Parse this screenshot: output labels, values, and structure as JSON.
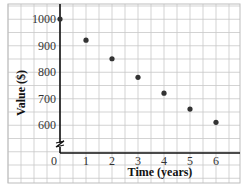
{
  "chart_data": {
    "type": "scatter",
    "title": "",
    "xlabel": "Time (years)",
    "ylabel": "Value ($)",
    "x": [
      0,
      1,
      2,
      3,
      4,
      5,
      6
    ],
    "series": [
      {
        "name": "Value",
        "values": [
          1000,
          920,
          850,
          780,
          720,
          660,
          610
        ]
      }
    ],
    "x_ticks": [
      "0",
      "1",
      "2",
      "3",
      "4",
      "5",
      "6"
    ],
    "y_ticks": [
      "600",
      "700",
      "800",
      "900",
      "1000"
    ],
    "xlim": [
      0,
      7
    ],
    "ylim": [
      500,
      1050
    ],
    "grid": true,
    "axis_break": "y-axis break between 0 and 600",
    "legend": null,
    "colors": {
      "point": "#333333",
      "grid": "#c8c8c8",
      "axis": "#111111"
    }
  }
}
